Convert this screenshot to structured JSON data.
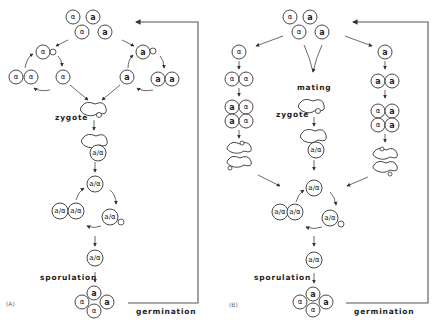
{
  "figure": {
    "panels": [
      {
        "id": "A",
        "label": "(A)",
        "stages": {
          "zygote_label": "zygote",
          "sporulation_label": "sporulation",
          "germination_label": "germination"
        },
        "cells": {
          "haploid_alpha": "α",
          "haploid_a": "a",
          "diploid": "a/α"
        }
      },
      {
        "id": "B",
        "label": "(B)",
        "stages": {
          "mating_label": "mating",
          "zygote_label": "zygote",
          "sporulation_label": "sporulation",
          "germination_label": "germination"
        },
        "cells": {
          "haploid_alpha": "α",
          "haploid_a": "a",
          "diploid": "a/α"
        }
      }
    ],
    "tetrad_spores_A": [
      "a",
      "α",
      "a",
      "α"
    ],
    "tetrad_spores_B": [
      "a",
      "α",
      "a",
      "α"
    ]
  }
}
